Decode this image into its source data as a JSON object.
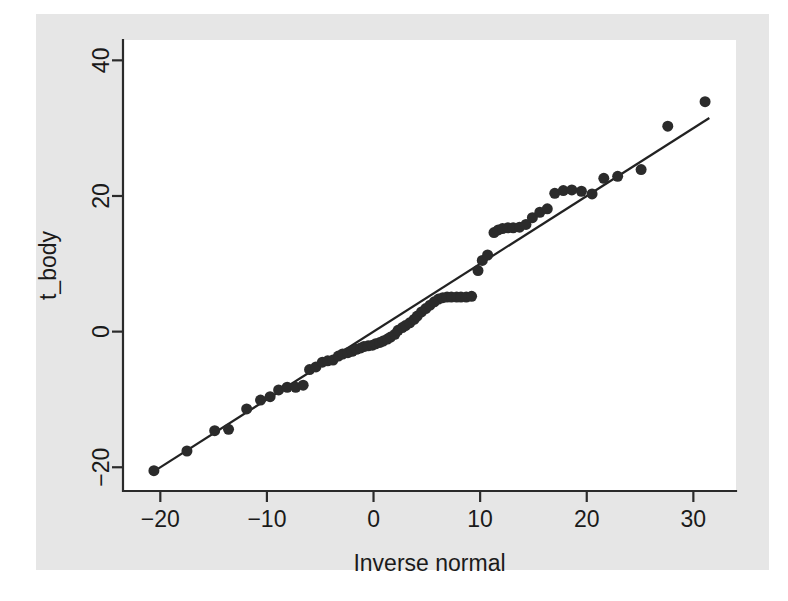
{
  "chart_data": {
    "type": "scatter",
    "title": "",
    "subtitle": "",
    "xlabel": "Inverse normal",
    "ylabel": "t_body",
    "xlim": [
      -23.5,
      34.0
    ],
    "ylim": [
      -23.5,
      43.0
    ],
    "xticks": [
      -20,
      -10,
      0,
      10,
      20,
      30
    ],
    "xtick_labels": [
      "-20",
      "-10",
      "0",
      "10",
      "20",
      "30"
    ],
    "yticks": [
      -20,
      0,
      20,
      40
    ],
    "ytick_labels": [
      "-20",
      "0",
      "20",
      "40"
    ],
    "grid": false,
    "legend": null,
    "legend_position": "none",
    "marker": "filled-circle",
    "marker_color": "#2b2b2b",
    "marker_size_px": 11,
    "background_color": "#e6e6e6",
    "plot_area_color": "#ffffff",
    "axis_color": "#2b2b2b",
    "reference_line": {
      "label": "45-degree reference line",
      "color": "#222222",
      "x": [
        -20.6,
        31.5
      ],
      "y": [
        -20.6,
        31.5
      ]
    },
    "series": [
      {
        "name": "t_body quantiles",
        "points": [
          [
            -20.6,
            -20.5
          ],
          [
            -17.5,
            -17.6
          ],
          [
            -14.9,
            -14.6
          ],
          [
            -13.6,
            -14.4
          ],
          [
            -11.9,
            -11.4
          ],
          [
            -10.6,
            -10.1
          ],
          [
            -9.7,
            -9.6
          ],
          [
            -8.9,
            -8.6
          ],
          [
            -8.1,
            -8.2
          ],
          [
            -7.3,
            -8.2
          ],
          [
            -6.6,
            -7.9
          ],
          [
            -6.0,
            -5.6
          ],
          [
            -5.4,
            -5.2
          ],
          [
            -4.8,
            -4.5
          ],
          [
            -4.3,
            -4.3
          ],
          [
            -3.8,
            -4.2
          ],
          [
            -3.3,
            -3.6
          ],
          [
            -2.9,
            -3.3
          ],
          [
            -2.4,
            -3.1
          ],
          [
            -2.0,
            -2.9
          ],
          [
            -1.6,
            -2.6
          ],
          [
            -1.2,
            -2.4
          ],
          [
            -0.9,
            -2.2
          ],
          [
            -0.5,
            -2.1
          ],
          [
            -0.1,
            -2.0
          ],
          [
            0.2,
            -1.8
          ],
          [
            0.6,
            -1.6
          ],
          [
            0.9,
            -1.4
          ],
          [
            1.3,
            -1.1
          ],
          [
            1.6,
            -0.8
          ],
          [
            2.0,
            -0.4
          ],
          [
            2.3,
            0.2
          ],
          [
            2.7,
            0.6
          ],
          [
            3.0,
            0.9
          ],
          [
            3.4,
            1.3
          ],
          [
            3.8,
            1.8
          ],
          [
            4.1,
            2.3
          ],
          [
            4.5,
            2.9
          ],
          [
            4.9,
            3.4
          ],
          [
            5.3,
            3.9
          ],
          [
            5.7,
            4.4
          ],
          [
            6.1,
            4.8
          ],
          [
            6.5,
            5.0
          ],
          [
            6.9,
            5.1
          ],
          [
            7.3,
            5.1
          ],
          [
            7.8,
            5.1
          ],
          [
            8.2,
            5.1
          ],
          [
            8.7,
            5.1
          ],
          [
            9.2,
            5.2
          ],
          [
            9.8,
            9.0
          ],
          [
            10.2,
            10.5
          ],
          [
            10.7,
            11.3
          ],
          [
            11.3,
            14.6
          ],
          [
            11.7,
            15.0
          ],
          [
            12.1,
            15.2
          ],
          [
            12.6,
            15.3
          ],
          [
            13.1,
            15.3
          ],
          [
            13.7,
            15.4
          ],
          [
            14.3,
            15.8
          ],
          [
            14.9,
            16.8
          ],
          [
            15.6,
            17.6
          ],
          [
            16.3,
            18.1
          ],
          [
            17.0,
            20.4
          ],
          [
            17.8,
            20.8
          ],
          [
            18.6,
            20.9
          ],
          [
            19.5,
            20.7
          ],
          [
            20.5,
            20.3
          ],
          [
            21.6,
            22.6
          ],
          [
            22.9,
            22.9
          ],
          [
            25.1,
            23.9
          ],
          [
            27.6,
            30.3
          ],
          [
            31.1,
            33.9
          ]
        ]
      }
    ]
  }
}
